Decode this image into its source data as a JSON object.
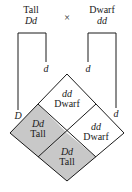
{
  "parents": {
    "left": {
      "phenotype": "Tall",
      "genotype": "Dd"
    },
    "cross_symbol": "×",
    "right": {
      "phenotype": "Dwarf",
      "genotype": "dd"
    }
  },
  "gametes": {
    "left_parent": [
      "D",
      "d"
    ],
    "right_parent": [
      "d",
      "d"
    ]
  },
  "offspring": [
    {
      "position": "top",
      "genotype": "dd",
      "phenotype": "Dwarf",
      "shaded": false
    },
    {
      "position": "left",
      "genotype": "Dd",
      "phenotype": "Tall",
      "shaded": true
    },
    {
      "position": "right",
      "genotype": "dd",
      "phenotype": "Dwarf",
      "shaded": false
    },
    {
      "position": "bottom",
      "genotype": "Dd",
      "phenotype": "Tall",
      "shaded": true
    }
  ],
  "colors": {
    "shaded": "#c8c8c8",
    "unshaded": "#ffffff",
    "line": "#1a1a1a"
  }
}
